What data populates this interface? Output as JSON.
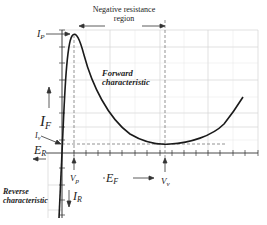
{
  "diagram": {
    "labels": {
      "negative_resistance_line1": "Negative resistance",
      "negative_resistance_line2": "region",
      "ip": "I",
      "ip_sub": "P",
      "iv": "I",
      "iv_sub": "v",
      "if": "I",
      "if_sub": "F",
      "ir": "I",
      "ir_sub": "R",
      "er": "E",
      "er_sub": "R",
      "ef": "E",
      "ef_sub": "F",
      "vp": "V",
      "vp_sub": "p",
      "vv": "V",
      "vv_sub": "v",
      "forward_line1": "Forward",
      "forward_line2": "characteristic",
      "reverse_line1": "Reverse",
      "reverse_line2": "characteristic"
    },
    "colors": {
      "curve": "#1a1a1a",
      "grid": "#d4d4d4",
      "axis": "#333333",
      "dashed": "#666666",
      "text": "#222222"
    },
    "key_points": {
      "peak": {
        "label": "Ip / Vp",
        "x": 74,
        "y": 35
      },
      "valley": {
        "label": "Iv / Vv",
        "x": 165,
        "y": 144
      },
      "origin": {
        "x": 62,
        "y": 153
      }
    }
  }
}
